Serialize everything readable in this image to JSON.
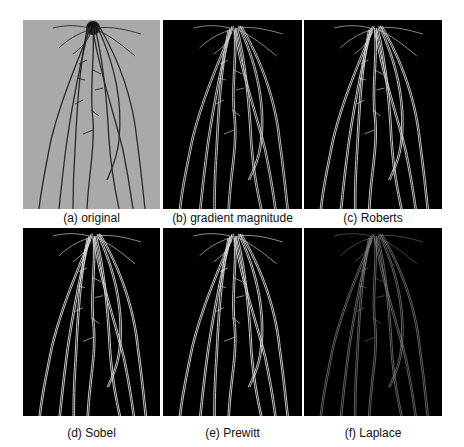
{
  "figure": {
    "panels": [
      {
        "id": "a",
        "caption": "(a) original",
        "style": "photo",
        "background": "#a9a9a9",
        "stroke": "#2a2a2a"
      },
      {
        "id": "b",
        "caption": "(b) gradient magnitude",
        "style": "edge",
        "background": "#000000",
        "stroke": "#cfcfcf"
      },
      {
        "id": "c",
        "caption": "(c) Roberts",
        "style": "edge",
        "background": "#000000",
        "stroke": "#d8d8d8"
      },
      {
        "id": "d",
        "caption": "(d) Sobel",
        "style": "edge",
        "background": "#000000",
        "stroke": "#e0e0e0"
      },
      {
        "id": "e",
        "caption": "(e) Prewitt",
        "style": "edge",
        "background": "#000000",
        "stroke": "#dddddd"
      },
      {
        "id": "f",
        "caption": "(f) Laplace",
        "style": "edge-faint",
        "background": "#000000",
        "stroke": "#8a8a8a"
      }
    ]
  }
}
